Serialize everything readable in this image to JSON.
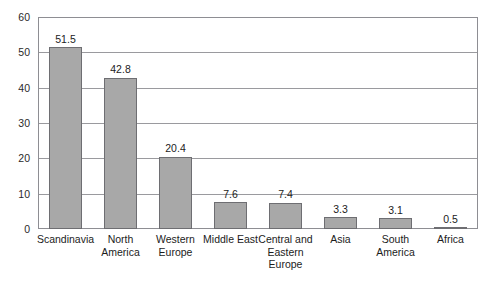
{
  "chart_data": {
    "type": "bar",
    "title": "",
    "xlabel": "",
    "ylabel": "",
    "ylim": [
      0,
      60
    ],
    "yticks": [
      0,
      10,
      20,
      30,
      40,
      50,
      60
    ],
    "grid": true,
    "legend": null,
    "categories": [
      "Scandinavia",
      "North America",
      "Western Europe",
      "Middle East",
      "Central and Eastern Europe",
      "Asia",
      "South America",
      "Africa"
    ],
    "category_lines": [
      [
        "Scandinavia"
      ],
      [
        "North",
        "America"
      ],
      [
        "Western",
        "Europe"
      ],
      [
        "Middle East"
      ],
      [
        "Central and",
        "Eastern",
        "Europe"
      ],
      [
        "Asia"
      ],
      [
        "South",
        "America"
      ],
      [
        "Africa"
      ]
    ],
    "values": [
      51.5,
      42.8,
      20.4,
      7.6,
      7.4,
      3.3,
      3.1,
      0.5
    ],
    "value_labels": [
      "51.5",
      "42.8",
      "20.4",
      "7.6",
      "7.4",
      "3.3",
      "3.1",
      "0.5"
    ],
    "bar_color": "#a8a8a8",
    "bar_border_color": "#6e6e72",
    "grid_color": "#9a9a9e",
    "frame_color": "#8e8e93",
    "background": "#ffffff"
  },
  "clipped_title": ""
}
